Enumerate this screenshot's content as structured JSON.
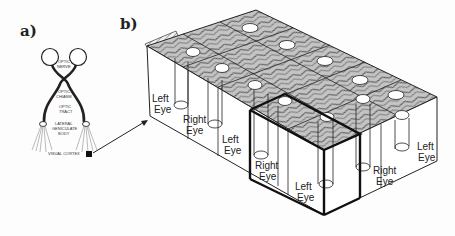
{
  "panels": {
    "a": {
      "label": "a)",
      "structures": [
        "OPTIC NERVE",
        "OPTIC CHIASM",
        "OPTIC TRACT",
        "LATERAL GENICULATE BODY",
        "VISUAL CORTEX"
      ],
      "text": {
        "optic_nerve_1": "OPTIC",
        "optic_nerve_2": "NERVE",
        "optic_chiasm_1": "OPTIC",
        "optic_chiasm_2": "CHIASM",
        "optic_tract_1": "OPTIC",
        "optic_tract_2": "TRACT",
        "lgb_1": "LATERAL",
        "lgb_2": "GENICULATE",
        "lgb_3": "BODY",
        "visual_cortex": "VISUAL CORTEX"
      }
    },
    "b": {
      "label": "b)",
      "eye_labels": [
        {
          "line1": "Left",
          "line2": "Eye"
        },
        {
          "line1": "Right",
          "line2": "Eye"
        },
        {
          "line1": "Left",
          "line2": "Eye"
        },
        {
          "line1": "Right",
          "line2": "Eye"
        },
        {
          "line1": "Left",
          "line2": "Eye"
        },
        {
          "line1": "Right",
          "line2": "Eye"
        },
        {
          "line1": "Left",
          "line2": "Eye"
        }
      ]
    }
  },
  "colors": {
    "line": "#1a1a1a",
    "surface": "#bdbdbd",
    "background": "#fdfdfd"
  }
}
